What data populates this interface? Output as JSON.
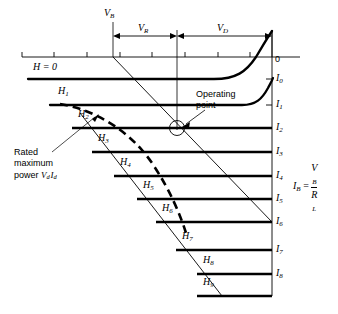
{
  "figure": {
    "title_alt": "Magnetic amplifier / transistor load-line characteristic family",
    "axis": {
      "origin_label": "0",
      "tick_count": 8
    },
    "voltage_spans": [
      {
        "name": "V_B",
        "label": "V",
        "sub": "B",
        "kind": "tick-label"
      },
      {
        "name": "V_R",
        "label": "V",
        "sub": "R",
        "kind": "dimension"
      },
      {
        "name": "V_D",
        "label": "V",
        "sub": "D",
        "kind": "dimension"
      }
    ],
    "curve_labels": [
      {
        "label": "H = 0",
        "plain": true,
        "x": 33,
        "y": 68
      },
      {
        "label": "H",
        "sub": "1",
        "x": 58,
        "y": 92
      },
      {
        "label": "H",
        "sub": "2",
        "x": 78,
        "y": 115
      },
      {
        "label": "H",
        "sub": "3",
        "x": 98,
        "y": 140
      },
      {
        "label": "H",
        "sub": "4",
        "x": 120,
        "y": 163
      },
      {
        "label": "H",
        "sub": "5",
        "x": 143,
        "y": 186
      },
      {
        "label": "H",
        "sub": "6",
        "x": 163,
        "y": 209
      },
      {
        "label": "H",
        "sub": "7",
        "x": 183,
        "y": 237
      },
      {
        "label": "H",
        "sub": "8",
        "x": 204,
        "y": 262
      },
      {
        "label": "H",
        "sub": "9",
        "x": 204,
        "y": 285
      }
    ],
    "current_labels": [
      {
        "label": "I",
        "sub": "0",
        "y": 79
      },
      {
        "label": "I",
        "sub": "1",
        "y": 105
      },
      {
        "label": "I",
        "sub": "2",
        "y": 128
      },
      {
        "label": "I",
        "sub": "3",
        "y": 152
      },
      {
        "label": "I",
        "sub": "4",
        "y": 176
      },
      {
        "label": "I",
        "sub": "5",
        "y": 199
      },
      {
        "label": "I",
        "sub": "6",
        "y": 222
      },
      {
        "label": "I",
        "sub": "7",
        "y": 250
      },
      {
        "label": "I",
        "sub": "8",
        "y": 274
      }
    ],
    "annotations": {
      "operating_point": "Operating\npoint",
      "operating_point_line1": "Operating",
      "operating_point_line2": "point",
      "rated_line1": "Rated",
      "rated_line2": "maximum",
      "rated_line3_prefix": "power ",
      "rated_V": "V",
      "rated_V_sub": "d",
      "rated_I": "I",
      "rated_I_sub": "d"
    },
    "equation": {
      "lhs": "I",
      "lhs_sub": "B",
      "equals": "=",
      "numerator": "V",
      "numerator_sub": "B",
      "denominator": "R",
      "denominator_sub": "L"
    },
    "colors": {
      "ink": "#000000",
      "background": "#ffffff",
      "thin_line": "#1a1a1a"
    }
  }
}
